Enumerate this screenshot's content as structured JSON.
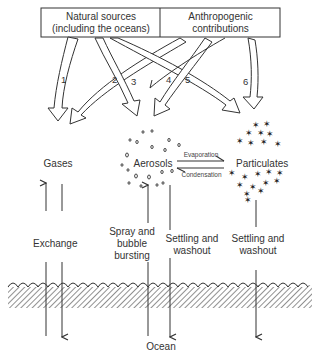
{
  "sources": {
    "natural": {
      "line1": "Natural sources",
      "line2": "(including the oceans)"
    },
    "anthropogenic": {
      "line1": "Anthropogenic",
      "line2": "contributions"
    }
  },
  "pathways": [
    "1",
    "2",
    "3",
    "4",
    "5",
    "6"
  ],
  "reservoirs": {
    "gases": "Gases",
    "aerosols": "Aerosols",
    "particulates": "Particulates"
  },
  "transitions": {
    "evaporation": "Evaporation",
    "condensation": "Condensation"
  },
  "processes": {
    "exchange": "Exchange",
    "spray_line1": "Spray and",
    "spray_line2": "bubble",
    "spray_line3": "bursting",
    "settling1_line1": "Settling and",
    "settling1_line2": "washout",
    "settling2_line1": "Settling and",
    "settling2_line2": "washout"
  },
  "ocean": {
    "label": "Ocean"
  }
}
